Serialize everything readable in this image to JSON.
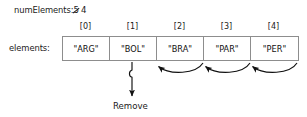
{
  "diagram": {
    "variable": {
      "label": "numElements:",
      "old_value": "5",
      "old_value_struck": true,
      "new_value": "4"
    },
    "array": {
      "label": "elements:",
      "indices": [
        "[0]",
        "[1]",
        "[2]",
        "[3]",
        "[4]"
      ],
      "values": [
        "\"ARG\"",
        "\"BOL\"",
        "\"BRA\"",
        "\"PAR\"",
        "\"PER\""
      ]
    },
    "annotations": {
      "remove_label": "Remove",
      "remove_from_index": "[1]",
      "shift_arrows": 3,
      "shift_direction": "left"
    },
    "colors": {
      "background": "#ffffff",
      "text": "#1a1a1a",
      "cell_border": "#8d8d8d",
      "arrow": "#111111"
    }
  }
}
